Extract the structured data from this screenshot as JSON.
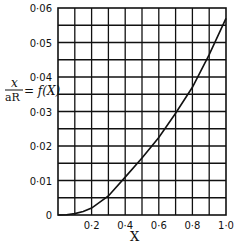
{
  "chart_data": {
    "type": "line",
    "title": "",
    "xlabel": "X",
    "ylabel": "x / aR = f(X)",
    "ylabel_parts": {
      "num": "x",
      "den": "aR",
      "rhs": "= f(X)"
    },
    "xlim": [
      0,
      1.0
    ],
    "ylim": [
      0,
      0.06
    ],
    "grid": true,
    "x_ticks": [
      "0.2",
      "0.4",
      "0.6",
      "0.8",
      "1.0"
    ],
    "x_tick_values": [
      0.2,
      0.4,
      0.6,
      0.8,
      1.0
    ],
    "y_ticks": [
      "0",
      "0.01",
      "0.02",
      "0.03",
      "0.04",
      "0.05",
      "0.06"
    ],
    "y_tick_values": [
      0,
      0.01,
      0.02,
      0.03,
      0.04,
      0.05,
      0.06
    ],
    "x_tick_display": [
      "0·2",
      "0·4",
      "0·6",
      "0·8",
      "1·0"
    ],
    "y_tick_display": [
      "0",
      "0·01",
      "0·02",
      "0·03",
      "0·04",
      "0·05",
      "0·06"
    ],
    "series": [
      {
        "name": "f(X)",
        "x": [
          0,
          0.05,
          0.1,
          0.15,
          0.2,
          0.3,
          0.4,
          0.5,
          0.6,
          0.7,
          0.8,
          0.9,
          1.0
        ],
        "values": [
          0,
          0.0001,
          0.0004,
          0.001,
          0.002,
          0.0055,
          0.011,
          0.0165,
          0.0225,
          0.0295,
          0.037,
          0.0465,
          0.057
        ]
      }
    ],
    "grid_divisions": {
      "x": 10,
      "y": 12
    }
  }
}
